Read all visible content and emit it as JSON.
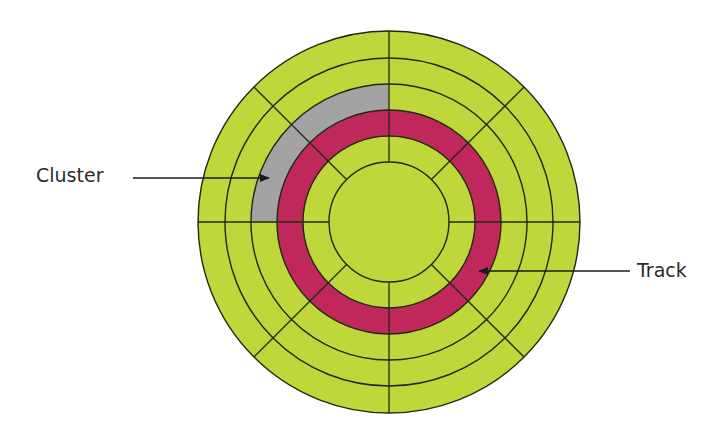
{
  "diagram": {
    "center": [
      389,
      222
    ],
    "ring_radii": [
      191,
      164,
      138,
      112,
      86,
      60
    ],
    "sector_angles_deg": [
      0,
      45,
      90,
      135,
      180,
      225,
      270,
      315
    ],
    "colors": {
      "platter": "#c0d73c",
      "track": "#c0285c",
      "cluster": "#a3a3a3",
      "line": "#1e2a10",
      "arrow": "#1a1a1a",
      "background": "#ffffff"
    },
    "highlighted_track": {
      "inner_radius": 86,
      "outer_radius": 112
    },
    "highlighted_cluster": {
      "inner_radius": 112,
      "outer_radius": 138,
      "start_angle_deg": 180,
      "end_angle_deg": 270
    }
  },
  "labels": {
    "cluster": {
      "text": "Cluster",
      "arrow_from": [
        133,
        178
      ],
      "arrow_to": [
        269,
        178
      ]
    },
    "track": {
      "text": "Track",
      "arrow_from": [
        630,
        271
      ],
      "arrow_to": [
        479,
        271
      ]
    }
  }
}
